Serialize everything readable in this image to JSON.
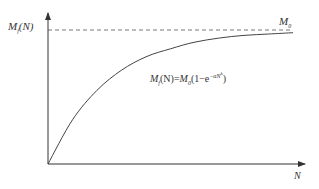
{
  "chart_data": {
    "type": "line",
    "title": "",
    "xlabel": "N",
    "ylabel": "M_f(N)",
    "asymptote_label": "M_0",
    "formula": "M_f(N)=M_0(1−e^{−αN^k})",
    "series": [
      {
        "name": "M_f(N)",
        "description": "saturating exponential growth from origin approaching M_0",
        "x": [
          0,
          0.1,
          0.2,
          0.3,
          0.4,
          0.5,
          0.6,
          0.7,
          0.8,
          0.9,
          1.0
        ],
        "values": [
          0,
          0.33,
          0.55,
          0.7,
          0.8,
          0.86,
          0.91,
          0.94,
          0.96,
          0.97,
          0.98
        ]
      }
    ],
    "reference_lines": [
      {
        "type": "horizontal",
        "value": 1.0,
        "style": "dashed",
        "label": "M_0"
      }
    ],
    "ylim": [
      0,
      1.1
    ],
    "xlim": [
      0,
      1.05
    ],
    "grid": false,
    "legend": "none",
    "ticks": "none"
  },
  "labels": {
    "y_axis": {
      "main": "M",
      "sub": "f",
      "rest": "(N)"
    },
    "x_axis": "N",
    "asymptote": {
      "main": "M",
      "sub": "0"
    },
    "formula": {
      "lhs_main": "M",
      "lhs_sub": "f",
      "lhs_rest": "(N)=",
      "rhs_main": "M",
      "rhs_sub": "0",
      "rhs_open": "(1−e",
      "exponent": "−αN",
      "exponent_power": "k",
      "rhs_close": ")"
    }
  },
  "colors": {
    "axis": "#333333",
    "curve": "#444444",
    "dashed": "#555555",
    "text": "#333333"
  }
}
